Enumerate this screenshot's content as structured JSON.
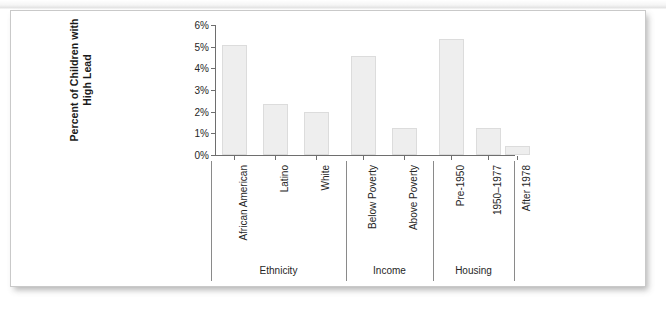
{
  "figure": {
    "card_background": "#ffffff",
    "card_border_color": "#c9c9c9"
  },
  "chart_data": {
    "type": "bar",
    "title": "",
    "xlabel": "",
    "ylabel": "Percent of Children with High Lead",
    "ylabel_line1": "Percent of Children with",
    "ylabel_line2": "High Lead",
    "categories": [
      "African American",
      "Latino",
      "White",
      "Below Poverty",
      "Above Poverty",
      "Pre-1950",
      "1950–1977",
      "After 1978"
    ],
    "values": [
      5.1,
      2.35,
      2.0,
      4.55,
      1.25,
      5.35,
      1.25,
      0.4
    ],
    "value_labels": [
      "5.1%",
      "2.35%",
      "2.0%",
      "4.55%",
      "1.25%",
      "5.35%",
      "1.25%",
      "0.4%"
    ],
    "ylim": [
      0,
      6
    ],
    "ytick_values": [
      0,
      1,
      2,
      3,
      4,
      5,
      6
    ],
    "ytick_labels": [
      "0%",
      "1%",
      "2%",
      "3%",
      "4%",
      "5%",
      "6%"
    ],
    "grid": false,
    "legend": false,
    "legend_position": "none",
    "bar_color": "#eeeeee",
    "bar_edge_color": "#dcdcdc",
    "axis_color": "#6e6e6e",
    "groups": [
      {
        "label": "Ethnicity",
        "categories": [
          "African American",
          "Latino",
          "White"
        ]
      },
      {
        "label": "Income",
        "categories": [
          "Below Poverty",
          "Above Poverty"
        ]
      },
      {
        "label": "Housing",
        "categories": [
          "Pre-1950",
          "1950–1977",
          "After 1978"
        ]
      }
    ],
    "group_labels": [
      "Ethnicity",
      "Income",
      "Housing"
    ]
  }
}
